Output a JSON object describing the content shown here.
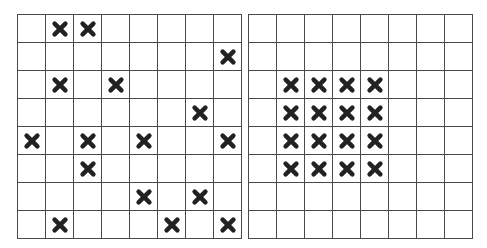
{
  "figure": {
    "rows": 8,
    "cols": 8,
    "mark_symbol": "heavy-x-icon",
    "mark_color": "#222222",
    "line_color": "#4a4a4a",
    "grids": [
      {
        "id": "left",
        "marked_cells": [
          [
            0,
            1
          ],
          [
            0,
            2
          ],
          [
            1,
            7
          ],
          [
            2,
            1
          ],
          [
            2,
            3
          ],
          [
            3,
            6
          ],
          [
            4,
            0
          ],
          [
            4,
            2
          ],
          [
            4,
            4
          ],
          [
            4,
            7
          ],
          [
            5,
            2
          ],
          [
            6,
            4
          ],
          [
            6,
            6
          ],
          [
            7,
            1
          ],
          [
            7,
            5
          ],
          [
            7,
            7
          ]
        ]
      },
      {
        "id": "right",
        "marked_cells": [
          [
            2,
            1
          ],
          [
            2,
            2
          ],
          [
            2,
            3
          ],
          [
            2,
            4
          ],
          [
            3,
            1
          ],
          [
            3,
            2
          ],
          [
            3,
            3
          ],
          [
            3,
            4
          ],
          [
            4,
            1
          ],
          [
            4,
            2
          ],
          [
            4,
            3
          ],
          [
            4,
            4
          ],
          [
            5,
            1
          ],
          [
            5,
            2
          ],
          [
            5,
            3
          ],
          [
            5,
            4
          ]
        ]
      }
    ]
  }
}
